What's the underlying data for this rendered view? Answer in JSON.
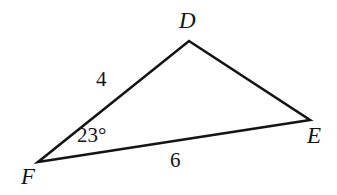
{
  "figure": {
    "type": "triangle-diagram",
    "background_color": "#ffffff",
    "stroke_color": "#141414",
    "stroke_width": 2.6,
    "vertices": [
      {
        "name": "D",
        "label": "D",
        "x": 189,
        "y": 41,
        "label_x": 179,
        "label_y": 9
      },
      {
        "name": "E",
        "label": "E",
        "x": 310,
        "y": 120,
        "label_x": 307,
        "label_y": 124
      },
      {
        "name": "F",
        "label": "F",
        "x": 38,
        "y": 162,
        "label_x": 21,
        "label_y": 165
      }
    ],
    "sides": [
      {
        "name": "DF",
        "label": "4",
        "from": "F",
        "to": "D",
        "label_x": 96,
        "label_y": 69
      },
      {
        "name": "FE",
        "label": "6",
        "from": "F",
        "to": "E",
        "label_x": 170,
        "label_y": 150
      },
      {
        "name": "DE",
        "label": "",
        "from": "D",
        "to": "E"
      }
    ],
    "angles": [
      {
        "at_vertex": "F",
        "label": "23°",
        "value": 23,
        "unit": "degrees",
        "label_x": 77,
        "label_y": 125
      }
    ]
  }
}
